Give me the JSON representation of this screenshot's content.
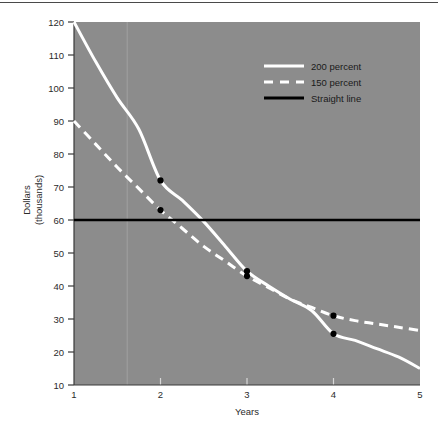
{
  "chart_data": {
    "type": "line",
    "title": "",
    "xlabel": "Years",
    "ylabel": "Dollars\n(thousands)",
    "ylabel_line1": "Dollars",
    "ylabel_line2": "(thousands)",
    "xlim": [
      1,
      5
    ],
    "ylim": [
      10,
      120
    ],
    "xticks": [
      1,
      2,
      3,
      4,
      5
    ],
    "xtick_labels": [
      "1",
      "2",
      "3",
      "4",
      "5"
    ],
    "yticks": [
      10,
      20,
      30,
      40,
      50,
      60,
      70,
      80,
      90,
      100,
      110,
      120
    ],
    "ytick_labels": [
      "10",
      "20",
      "30",
      "40",
      "50",
      "60",
      "70",
      "80",
      "90",
      "100",
      "110",
      "120"
    ],
    "grid": false,
    "legend_position": "upper right",
    "plot_background": "#8c8c8c",
    "series": [
      {
        "name": "200 percent",
        "style": "solid",
        "color": "#ffffff",
        "x": [
          1,
          1.25,
          1.5,
          1.75,
          2,
          2.25,
          2.5,
          2.75,
          3,
          3.25,
          3.5,
          3.75,
          4,
          4.25,
          4.5,
          4.75,
          5
        ],
        "values": [
          120,
          108,
          97,
          87.5,
          72,
          66,
          59.5,
          52,
          44.5,
          40,
          36,
          32.5,
          25.5,
          23.5,
          21,
          18.5,
          15
        ],
        "markers": [
          {
            "x": 2,
            "y": 72
          },
          {
            "x": 3,
            "y": 44.5
          },
          {
            "x": 4,
            "y": 25.5
          }
        ]
      },
      {
        "name": "150 percent",
        "style": "dashed",
        "color": "#ffffff",
        "x": [
          1,
          1.25,
          1.5,
          1.75,
          2,
          2.25,
          2.5,
          2.75,
          3,
          3.25,
          3.5,
          3.75,
          4,
          4.25,
          4.5,
          4.75,
          5
        ],
        "values": [
          90,
          83,
          76,
          69.5,
          63,
          57.5,
          52,
          47.5,
          43,
          39.5,
          36,
          33.5,
          31,
          29.5,
          28.5,
          27.5,
          26.5
        ],
        "markers": [
          {
            "x": 2,
            "y": 63
          },
          {
            "x": 3,
            "y": 43
          },
          {
            "x": 4,
            "y": 31
          }
        ]
      },
      {
        "name": "Straight line",
        "style": "solid",
        "color": "#000000",
        "x": [
          1,
          5
        ],
        "values": [
          60,
          60
        ],
        "markers": []
      }
    ],
    "legend_entries": [
      {
        "label": "200 percent",
        "style": "solid",
        "color": "#ffffff"
      },
      {
        "label": "150 percent",
        "style": "dashed",
        "color": "#ffffff"
      },
      {
        "label": "Straight line",
        "style": "solid",
        "color": "#000000"
      }
    ]
  }
}
